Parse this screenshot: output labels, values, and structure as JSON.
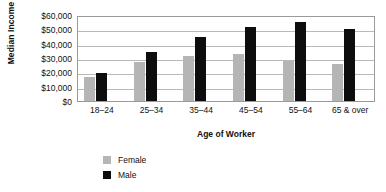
{
  "chart_data": {
    "type": "bar",
    "title": "",
    "xlabel": "Age of Worker",
    "ylabel": "Median Income",
    "categories": [
      "18–24",
      "25–34",
      "35–44",
      "45–54",
      "55–64",
      "65 & over"
    ],
    "series": [
      {
        "name": "Female",
        "color": "#b5b5b5",
        "values": [
          16500,
          27000,
          31500,
          32500,
          28000,
          26000
        ]
      },
      {
        "name": "Male",
        "color": "#0d0d0d",
        "values": [
          19800,
          34000,
          44500,
          51500,
          55000,
          50500
        ]
      }
    ],
    "ylim": [
      0,
      60000
    ],
    "ytick_values": [
      0,
      10000,
      20000,
      30000,
      40000,
      50000,
      60000
    ],
    "ytick_labels": [
      "$0",
      "$10,000",
      "$20,000",
      "$30,000",
      "$40,000",
      "$50,000",
      "$60,000"
    ],
    "grid": true,
    "legend_position": "bottom-left"
  },
  "axis": {
    "y_title": "Median Income",
    "x_title": "Age of Worker"
  },
  "legend": {
    "items": [
      {
        "label": "Female",
        "swatch": "#b5b5b5"
      },
      {
        "label": "Male",
        "swatch": "#0d0d0d"
      }
    ]
  }
}
